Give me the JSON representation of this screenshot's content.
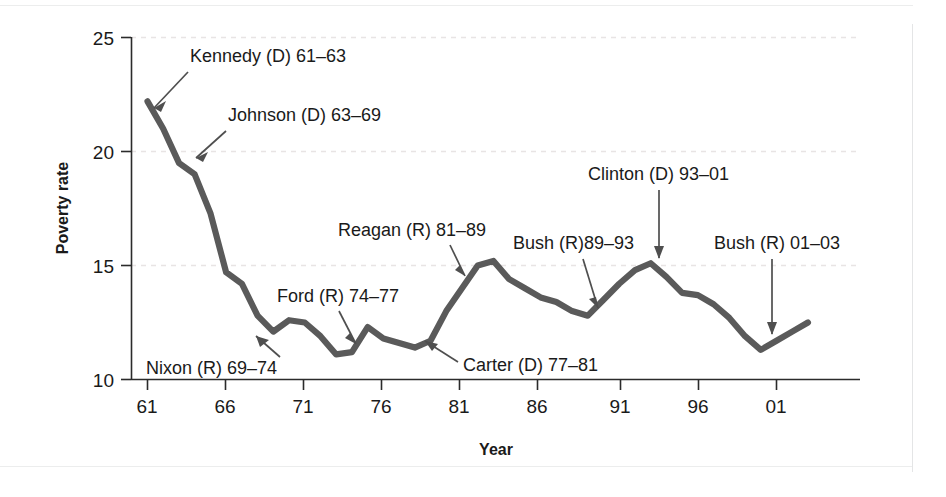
{
  "chart_data": {
    "type": "line",
    "title": "",
    "subtitle": "",
    "xlabel": "Year",
    "ylabel": "Poverty rate",
    "xlim": [
      61,
      63.5
    ],
    "ylim": [
      10,
      25
    ],
    "grid": true,
    "legend_position": "none",
    "line_color": "#5a5a5a",
    "gridline_color": "#e8e4e4",
    "axis_color": "#2b2b2b",
    "x_tick_labels": [
      "61",
      "66",
      "71",
      "76",
      "81",
      "86",
      "91",
      "96",
      "01"
    ],
    "x_tick_values": [
      1961,
      1966,
      1971,
      1976,
      1981,
      1986,
      1991,
      1996,
      2001
    ],
    "y_tick_labels": [
      "10",
      "15",
      "20",
      "25"
    ],
    "y_tick_values": [
      10,
      15,
      20,
      25
    ],
    "x_axis_range_years": [
      1961,
      2003
    ],
    "x": [
      1961,
      1962,
      1963,
      1964,
      1965,
      1966,
      1967,
      1968,
      1969,
      1970,
      1971,
      1972,
      1973,
      1974,
      1975,
      1976,
      1977,
      1978,
      1979,
      1980,
      1981,
      1982,
      1983,
      1984,
      1985,
      1986,
      1987,
      1988,
      1989,
      1990,
      1991,
      1992,
      1993,
      1994,
      1995,
      1996,
      1997,
      1998,
      1999,
      2000,
      2001,
      2002,
      2003
    ],
    "values": [
      22.2,
      21.0,
      19.5,
      19.0,
      17.3,
      14.7,
      14.2,
      12.8,
      12.1,
      12.6,
      12.5,
      11.9,
      11.1,
      11.2,
      12.3,
      11.8,
      11.6,
      11.4,
      11.7,
      13.0,
      14.0,
      15.0,
      15.2,
      14.4,
      14.0,
      13.6,
      13.4,
      13.0,
      12.8,
      13.5,
      14.2,
      14.8,
      15.1,
      14.5,
      13.8,
      13.7,
      13.3,
      12.7,
      11.9,
      11.3,
      11.7,
      12.1,
      12.5
    ]
  },
  "axes": {
    "x_title": "Year",
    "y_title": "Poverty rate",
    "x_ticks": [
      "61",
      "66",
      "71",
      "76",
      "81",
      "86",
      "91",
      "96",
      "01"
    ],
    "y_ticks": [
      "25",
      "20",
      "15",
      "10"
    ]
  },
  "annotations": [
    {
      "id": "kennedy",
      "label": "Kennedy (D) 61–63",
      "party": "D"
    },
    {
      "id": "johnson",
      "label": "Johnson (D) 63–69",
      "party": "D"
    },
    {
      "id": "nixon",
      "label": "Nixon (R) 69–74",
      "party": "R"
    },
    {
      "id": "ford",
      "label": "Ford (R) 74–77",
      "party": "R"
    },
    {
      "id": "carter",
      "label": "Carter (D) 77–81",
      "party": "D"
    },
    {
      "id": "reagan",
      "label": "Reagan (R) 81–89",
      "party": "R"
    },
    {
      "id": "bush41",
      "label": "Bush (R)89–93",
      "party": "R"
    },
    {
      "id": "clinton",
      "label": "Clinton (D) 93–01",
      "party": "D"
    },
    {
      "id": "bush43",
      "label": "Bush (R) 01–03",
      "party": "R"
    }
  ]
}
